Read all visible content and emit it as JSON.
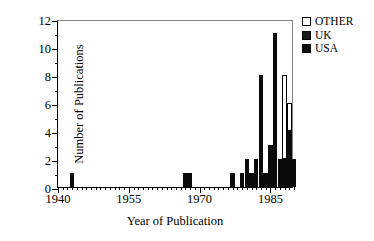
{
  "chart_data": {
    "type": "bar",
    "stacked": true,
    "title": "",
    "xlabel": "Year of Publication",
    "ylabel": "Number of Publications",
    "xlim": [
      1940,
      1990
    ],
    "ylim": [
      0,
      12
    ],
    "x_ticks": [
      1940,
      1955,
      1970,
      1985
    ],
    "x_tick_labels": [
      "1940",
      "1955",
      "1970",
      "1985"
    ],
    "x_minor_tick_step": 1,
    "y_ticks": [
      0,
      2,
      4,
      6,
      8,
      10,
      12
    ],
    "y_tick_labels": [
      "0",
      "2",
      "4",
      "6",
      "8",
      "10",
      "12"
    ],
    "y_minor_tick_step": 1,
    "grid": false,
    "legend_position": "top-right",
    "legend": [
      "OTHER",
      "UK",
      "USA"
    ],
    "series": [
      {
        "name": "USA",
        "color": "#0a0a0a"
      },
      {
        "name": "UK",
        "color": "#1c1c1c"
      },
      {
        "name": "OTHER",
        "color": "#ffffff"
      }
    ],
    "categories": [
      1943,
      1967,
      1968,
      1977,
      1979,
      1980,
      1981,
      1982,
      1983,
      1984,
      1985,
      1986,
      1987,
      1988,
      1989,
      1990
    ],
    "data": [
      {
        "year": 1943,
        "usa": 1,
        "uk": 0,
        "other": 0,
        "total": 1
      },
      {
        "year": 1967,
        "usa": 1,
        "uk": 0,
        "other": 0,
        "total": 1
      },
      {
        "year": 1968,
        "usa": 1,
        "uk": 0,
        "other": 0,
        "total": 1
      },
      {
        "year": 1977,
        "usa": 1,
        "uk": 0,
        "other": 0,
        "total": 1
      },
      {
        "year": 1979,
        "usa": 1,
        "uk": 0,
        "other": 0,
        "total": 1
      },
      {
        "year": 1980,
        "usa": 2,
        "uk": 0,
        "other": 0,
        "total": 2
      },
      {
        "year": 1981,
        "usa": 1,
        "uk": 0,
        "other": 0,
        "total": 1
      },
      {
        "year": 1982,
        "usa": 2,
        "uk": 0,
        "other": 0,
        "total": 2
      },
      {
        "year": 1983,
        "usa": 8,
        "uk": 0,
        "other": 0,
        "total": 8
      },
      {
        "year": 1984,
        "usa": 1,
        "uk": 0,
        "other": 0,
        "total": 1
      },
      {
        "year": 1985,
        "usa": 3,
        "uk": 0,
        "other": 0,
        "total": 3
      },
      {
        "year": 1986,
        "usa": 11,
        "uk": 0,
        "other": 0,
        "total": 11
      },
      {
        "year": 1987,
        "usa": 2,
        "uk": 0,
        "other": 0,
        "total": 2
      },
      {
        "year": 1988,
        "usa": 2,
        "uk": 0,
        "other": 6,
        "total": 8
      },
      {
        "year": 1989,
        "usa": 4,
        "uk": 0,
        "other": 2,
        "total": 6
      },
      {
        "year": 1990,
        "usa": 2,
        "uk": 0,
        "other": 0,
        "total": 2
      }
    ]
  },
  "legend": {
    "items": [
      {
        "label": "OTHER",
        "key": "other"
      },
      {
        "label": "UK",
        "key": "uk"
      },
      {
        "label": "USA",
        "key": "usa"
      }
    ]
  },
  "axes": {
    "x_title": "Year of Publication",
    "y_title": "Number of Publications"
  }
}
